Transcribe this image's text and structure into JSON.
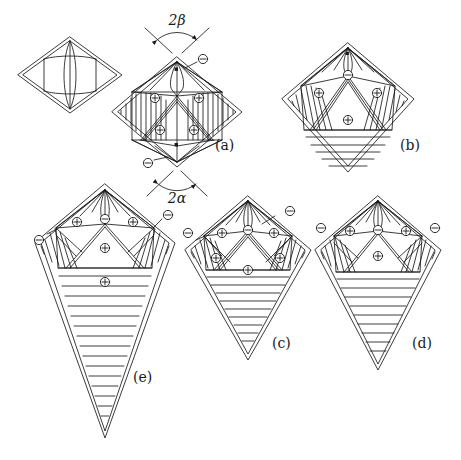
{
  "figure": {
    "title_visible": false,
    "background_color": "#ffffff",
    "ink_color": "#1a1a1a",
    "panels": [
      {
        "id": "seed",
        "label": "",
        "shape": "flat-rhombus",
        "description": "small undeformed rhombus with internal lens/vesica outline",
        "center": [
          70,
          75
        ],
        "plus_markers": 0,
        "minus_markers": 0,
        "has_horizontal_hatch": false
      },
      {
        "id": "a",
        "label": "(a)",
        "label_pos": [
          215,
          150
        ],
        "shape": "rhombus",
        "description": "rhombus with vertical hatching in left and right lobes, four plus disclinations, two minus disclinations at apexes",
        "center": [
          175,
          110
        ],
        "plus_markers": 4,
        "minus_markers": 2,
        "has_horizontal_hatch": false
      },
      {
        "id": "b",
        "label": "(b)",
        "label_pos": [
          400,
          150
        ],
        "shape": "kite",
        "description": "kite with two upper plus regions, one central plus, one minus at top vertex, horizontal hatching in lower triangle",
        "center": [
          348,
          105
        ],
        "plus_markers": 3,
        "minus_markers": 1,
        "has_horizontal_hatch": true
      },
      {
        "id": "c",
        "label": "(c)",
        "label_pos": [
          272,
          348
        ],
        "shape": "kite",
        "description": "kite with five plus regions, three minus disclinations, horizontal hatching in lower triangle",
        "center": [
          248,
          285
        ],
        "plus_markers": 5,
        "minus_markers": 3,
        "has_horizontal_hatch": true
      },
      {
        "id": "d",
        "label": "(d)",
        "label_pos": [
          412,
          348
        ],
        "shape": "kite",
        "description": "kite with three plus regions, three minus disclinations, horizontal hatching in lower triangle",
        "center": [
          378,
          285
        ],
        "plus_markers": 3,
        "minus_markers": 3,
        "has_horizontal_hatch": true
      },
      {
        "id": "e",
        "label": "(e)",
        "label_pos": [
          133,
          382
        ],
        "shape": "elongated-kite",
        "description": "large elongated kite, four plus regions, three minus disclinations, dense horizontal hatching in long lower triangle",
        "center": [
          105,
          300
        ],
        "plus_markers": 4,
        "minus_markers": 3,
        "has_horizontal_hatch": true
      }
    ],
    "annotations": [
      {
        "name": "angle-top",
        "text": "2β",
        "pos": [
          177,
          25
        ],
        "points_to": "apex angle at top vertex of panel (a)"
      },
      {
        "name": "angle-bottom",
        "text": "2α",
        "pos": [
          177,
          197
        ],
        "points_to": "apex angle at bottom vertex of panel (a)"
      }
    ],
    "symbols": {
      "plus": "⊕",
      "minus": "⊖",
      "plus_name": "positive-disclination",
      "minus_name": "negative-disclination"
    }
  }
}
